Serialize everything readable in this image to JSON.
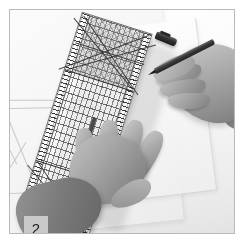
{
  "figure": {
    "kind": "instructional-photograph",
    "step_number": "2",
    "caption_badge": "2",
    "palette": {
      "matte": "#ffffff",
      "frame_rule": "#b9b9b9",
      "badge_background": "#c9c9c9",
      "badge_text": "#1c1c1c",
      "ruler_outline": "#6e6e6e",
      "pen_dark": "#1e1c1a",
      "skin_midtone": "#a9a39e",
      "sleeve_dark": "#6b6561",
      "paper_light": "#fdfdfd"
    }
  },
  "scene": {
    "description": "Black and white photograph of two hands using a transparent gridded quilting ruler on a sheet of paper",
    "objects": {
      "desk_surface": "desk-surface",
      "draft_sheet": "drafting-paper-sheet",
      "under_sheet": "translucent-sheet",
      "ruler": "transparent-grid-ruler",
      "left_hand": "left-hand-holding-ruler",
      "right_hand": "right-hand-holding-pencil",
      "pencil": "pencil",
      "pen_cap": "pen-cap"
    },
    "ruler": {
      "label": "transparent grid ruler",
      "features": [
        "edge-scale-left",
        "edge-scale-right",
        "hatched-zone-top",
        "diagonal-guide-lines",
        "index-block",
        "measurement-grid"
      ],
      "rotation_degrees": "17.5"
    },
    "pencil": {
      "label": "pencil",
      "rotation_degrees": "-27"
    },
    "pen_cap": {
      "label": "pen cap",
      "rotation_degrees": "22"
    }
  }
}
